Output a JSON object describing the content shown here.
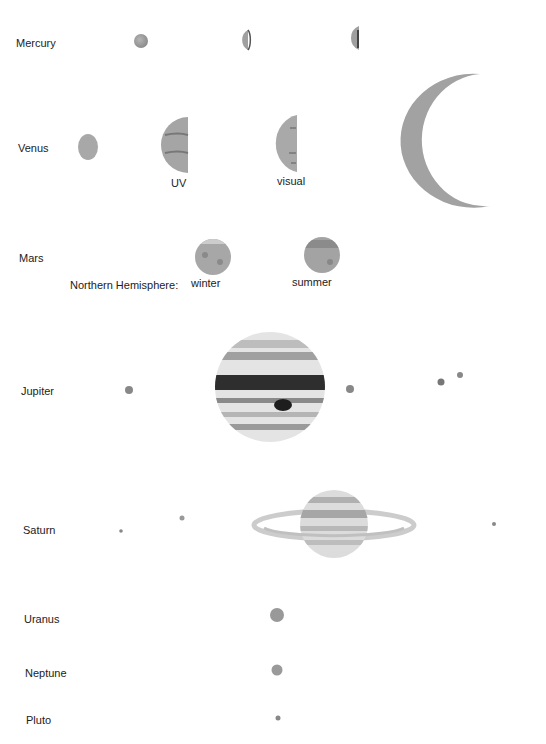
{
  "planets": {
    "mercury": {
      "label": "Mercury"
    },
    "venus": {
      "label": "Venus",
      "phase_labels": {
        "uv": "UV",
        "visual": "visual"
      }
    },
    "mars": {
      "label": "Mars",
      "hemisphere_label": "Northern Hemisphere:",
      "season_labels": {
        "winter": "winter",
        "summer": "summer"
      }
    },
    "jupiter": {
      "label": "Jupiter"
    },
    "saturn": {
      "label": "Saturn"
    },
    "uranus": {
      "label": "Uranus"
    },
    "neptune": {
      "label": "Neptune"
    },
    "pluto": {
      "label": "Pluto"
    }
  },
  "colors": {
    "planet_gray": "#9a9a9a",
    "dark_band": "#2a2a2a",
    "text": "#222222"
  }
}
